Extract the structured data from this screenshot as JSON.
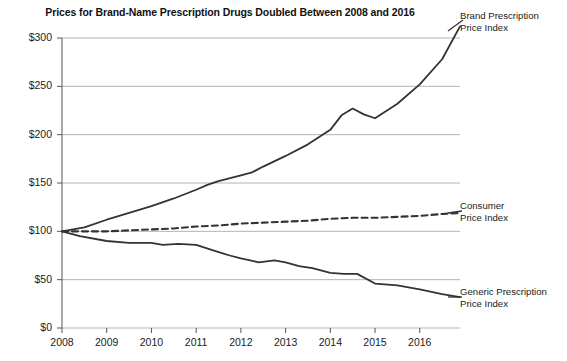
{
  "chart_data": {
    "type": "line",
    "title": "Prices for Brand-Name Prescription Drugs Doubled Between 2008 and 2016",
    "xlabel": "",
    "ylabel": "",
    "ylim": [
      0,
      300
    ],
    "xlim": [
      2008,
      2016.9
    ],
    "grid": true,
    "legend_position": "right-inline",
    "y_ticks": [
      "$0",
      "$50",
      "$100",
      "$150",
      "$200",
      "$250",
      "$300"
    ],
    "y_tick_values": [
      0,
      50,
      100,
      150,
      200,
      250,
      300
    ],
    "x_ticks": [
      "2008",
      "2009",
      "2010",
      "2011",
      "2012",
      "2013",
      "2014",
      "2015",
      "2016"
    ],
    "x_tick_values": [
      2008,
      2009,
      2010,
      2011,
      2012,
      2013,
      2014,
      2015,
      2016
    ],
    "series": [
      {
        "name": "Brand Prescription Price Index",
        "style": "solid",
        "label_line1": "Brand Prescription",
        "label_line2": "Price Index",
        "x": [
          2008.0,
          2008.5,
          2009.0,
          2009.5,
          2010.0,
          2010.5,
          2011.0,
          2011.25,
          2011.5,
          2012.0,
          2012.25,
          2012.5,
          2013.0,
          2013.5,
          2014.0,
          2014.25,
          2014.5,
          2014.75,
          2015.0,
          2015.5,
          2016.0,
          2016.5,
          2016.9
        ],
        "y": [
          100,
          104,
          112,
          119,
          126,
          134,
          143,
          148,
          152,
          158,
          161,
          167,
          178,
          190,
          205,
          220,
          227,
          221,
          217,
          232,
          252,
          278,
          312
        ]
      },
      {
        "name": "Consumer Price Index",
        "style": "dashed",
        "label_line1": "Consumer",
        "label_line2": "Price Index",
        "x": [
          2008.0,
          2008.5,
          2009.0,
          2009.5,
          2010.0,
          2010.5,
          2011.0,
          2011.5,
          2012.0,
          2012.5,
          2013.0,
          2013.5,
          2014.0,
          2014.5,
          2015.0,
          2015.5,
          2016.0,
          2016.5,
          2016.9
        ],
        "y": [
          100,
          100,
          100,
          101,
          102,
          103,
          105,
          106,
          108,
          109,
          110,
          111,
          113,
          114,
          114,
          115,
          116,
          118,
          119
        ]
      },
      {
        "name": "Generic Prescription Price Index",
        "style": "solid",
        "label_line1": "Generic Prescription",
        "label_line2": "Price Index",
        "x": [
          2008.0,
          2008.4,
          2009.0,
          2009.5,
          2010.0,
          2010.25,
          2010.6,
          2011.0,
          2011.4,
          2011.75,
          2012.0,
          2012.4,
          2012.75,
          2013.0,
          2013.3,
          2013.6,
          2014.0,
          2014.3,
          2014.6,
          2015.0,
          2015.5,
          2016.0,
          2016.5,
          2016.9
        ],
        "y": [
          100,
          95,
          90,
          88,
          88,
          86,
          87,
          86,
          80,
          75,
          72,
          68,
          70,
          68,
          64,
          62,
          57,
          56,
          56,
          46,
          44,
          40,
          35,
          32
        ]
      }
    ]
  },
  "legend": {
    "brand": {
      "line1": "Brand Prescription",
      "line2": "Price Index"
    },
    "consumer": {
      "line1": "Consumer",
      "line2": "Price Index"
    },
    "generic": {
      "line1": "Generic Prescription",
      "line2": "Price Index"
    }
  },
  "colors": {
    "line": "#333333",
    "grid": "#b4b4b4",
    "axis": "#555555",
    "text": "#1b1b1b"
  }
}
